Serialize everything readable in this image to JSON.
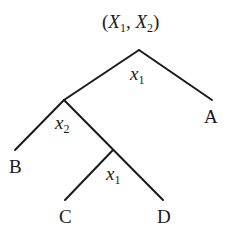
{
  "root_label": {
    "open": "(",
    "v1": "X",
    "s1": "1",
    "sep": ", ",
    "v2": "X",
    "s2": "2",
    "close": ")"
  },
  "edges": [
    {
      "from": "root",
      "to": "n2"
    },
    {
      "from": "root",
      "to": "A"
    },
    {
      "from": "n2",
      "to": "B"
    },
    {
      "from": "n2",
      "to": "n3"
    },
    {
      "from": "n3",
      "to": "C"
    },
    {
      "from": "n3",
      "to": "D"
    }
  ],
  "nodes": {
    "root": {
      "split": {
        "var": "x",
        "sub": "1"
      }
    },
    "n2": {
      "split": {
        "var": "x",
        "sub": "2"
      }
    },
    "n3": {
      "split": {
        "var": "x",
        "sub": "1"
      }
    }
  },
  "leaves": {
    "A": "A",
    "B": "B",
    "C": "C",
    "D": "D"
  },
  "line_color": "#1a1a1a"
}
